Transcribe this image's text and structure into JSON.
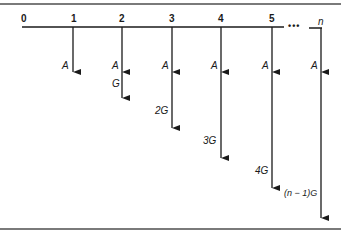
{
  "diagram": {
    "type": "cash-flow-diagram",
    "title": "",
    "time_labels": [
      "0",
      "1",
      "2",
      "3",
      "4",
      "5",
      "n"
    ],
    "ellipsis": "•••",
    "flows": [
      {
        "period": "1",
        "labels": [
          "A"
        ]
      },
      {
        "period": "2",
        "labels": [
          "A",
          "G"
        ]
      },
      {
        "period": "3",
        "labels": [
          "A",
          "2G"
        ]
      },
      {
        "period": "4",
        "labels": [
          "A",
          "3G"
        ]
      },
      {
        "period": "5",
        "labels": [
          "A",
          "4G"
        ]
      },
      {
        "period": "n",
        "labels": [
          "A",
          "(n − 1)G"
        ]
      }
    ],
    "line_color": "#1a1a1a",
    "frame_color": "#7a7a7a"
  }
}
